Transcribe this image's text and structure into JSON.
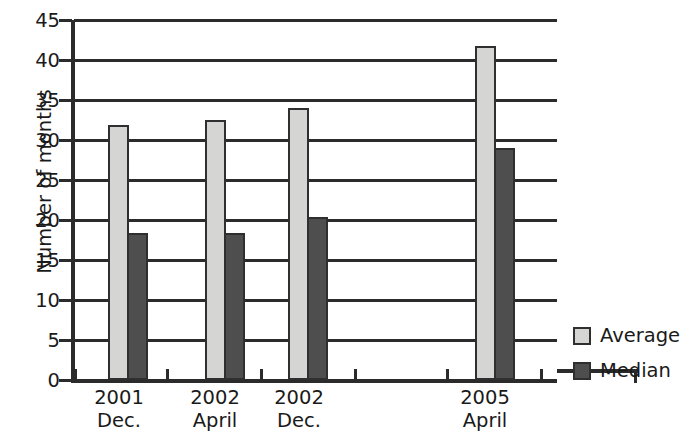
{
  "chart_data": {
    "type": "bar",
    "title": "",
    "xlabel": "",
    "ylabel": "Number of months",
    "ylim": [
      0,
      45
    ],
    "ytick_values": [
      0,
      5,
      10,
      15,
      20,
      25,
      30,
      35,
      40,
      45
    ],
    "ytick_labels": [
      "0",
      "5",
      "10",
      "15",
      "20",
      "25",
      "30",
      "35",
      "40",
      "45"
    ],
    "grid": true,
    "legend_position": "right-bottom",
    "categories": [
      "2001 Dec.",
      "2002 April",
      "2002 Dec.",
      "2005 April"
    ],
    "category_lines": [
      {
        "line1": "2001",
        "line2": "Dec."
      },
      {
        "line1": "2002",
        "line2": "April"
      },
      {
        "line1": "2002",
        "line2": "Dec."
      },
      {
        "line1": "2005",
        "line2": "April"
      }
    ],
    "series": [
      {
        "name": "Average",
        "color": "#d5d5d3",
        "values": [
          31.6,
          32.2,
          33.7,
          41.5
        ]
      },
      {
        "name": "Median",
        "color": "#4e4e4e",
        "values": [
          18.1,
          18.1,
          20.1,
          28.7
        ]
      }
    ]
  },
  "legend": {
    "items": [
      {
        "label": "Average",
        "swatch": "average"
      },
      {
        "label": "Median",
        "swatch": "median"
      }
    ]
  },
  "colors": {
    "average": "#d5d5d3",
    "median": "#4e4e4e",
    "axis": "#2b2b2b",
    "background": "#ffffff"
  }
}
